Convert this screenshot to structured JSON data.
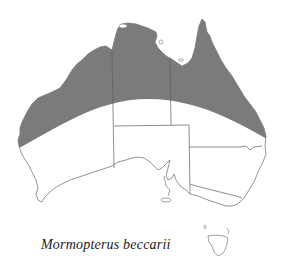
{
  "map": {
    "title": "Mormopterus beccarii",
    "region": "Australia",
    "legend": {
      "distribution_color": "#7b7b7b",
      "outline_color": "#777777",
      "background": "#ffffff"
    },
    "distribution": "northern Australia (shaded band across the northern third of the continent)"
  },
  "caption": {
    "species_name": "Mormopterus beccarii"
  }
}
